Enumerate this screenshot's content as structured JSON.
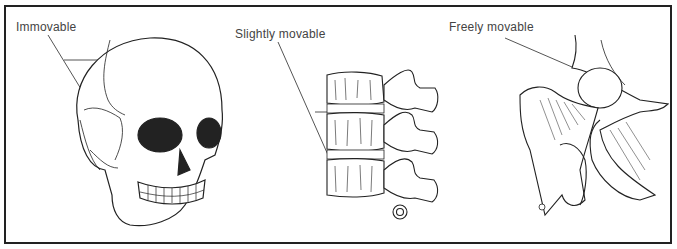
{
  "figure": {
    "panels": [
      {
        "id": "skull",
        "label": "Immovable",
        "illustration": "skull-sutures"
      },
      {
        "id": "spine",
        "label": "Slightly movable",
        "illustration": "vertebrae-intervertebral-discs"
      },
      {
        "id": "hip",
        "label": "Freely movable",
        "illustration": "hip-joint"
      }
    ],
    "colors": {
      "ink": "#222222",
      "label": "#444444",
      "background": "#ffffff"
    }
  }
}
